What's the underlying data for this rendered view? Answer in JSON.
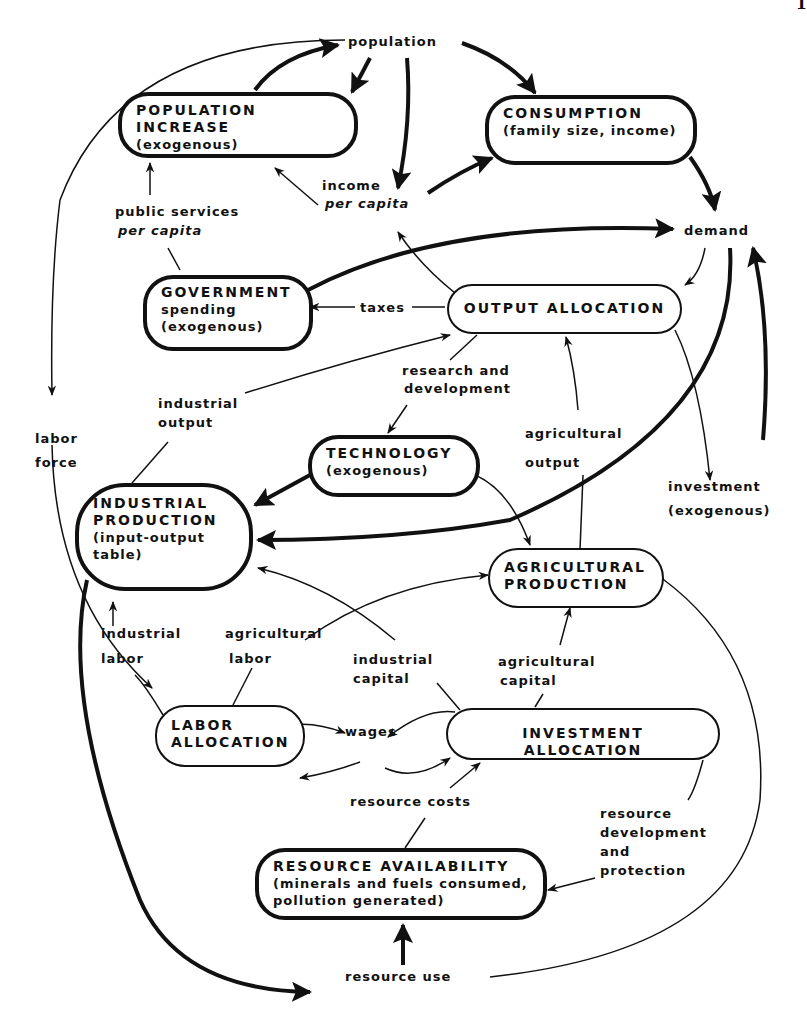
{
  "page_number": "1",
  "nodes": {
    "population_increase": {
      "title": "POPULATION INCREASE",
      "sub": "(exogenous)"
    },
    "consumption": {
      "title": "CONSUMPTION",
      "sub": "(family size, income)"
    },
    "government": {
      "title": "GOVERNMENT",
      "sub1": "spending",
      "sub2": "(exogenous)"
    },
    "output_allocation": {
      "title": "OUTPUT ALLOCATION"
    },
    "technology": {
      "title": "TECHNOLOGY",
      "sub": "(exogenous)"
    },
    "industrial_production": {
      "title1": "INDUSTRIAL",
      "title2": "PRODUCTION",
      "sub1": "(input-output",
      "sub2": "table)"
    },
    "agricultural_production": {
      "title1": "AGRICULTURAL",
      "title2": "PRODUCTION"
    },
    "labor_allocation": {
      "title1": "LABOR",
      "title2": "ALLOCATION"
    },
    "investment_allocation": {
      "title": "INVESTMENT ALLOCATION"
    },
    "resource_availability": {
      "title": "RESOURCE AVAILABILITY",
      "sub1": "(minerals and fuels consumed,",
      "sub2": "pollution generated)"
    }
  },
  "labels": {
    "population": "population",
    "income": "income",
    "per_capita_income": "per capita",
    "public_services": "public services",
    "per_capita_services": "per capita",
    "demand": "demand",
    "taxes": "taxes",
    "research_1": "research and",
    "research_2": "development",
    "industrial_output_1": "industrial",
    "industrial_output_2": "output",
    "labor_force_1": "labor",
    "labor_force_2": "force",
    "agricultural_output_1": "agricultural",
    "agricultural_output_2": "output",
    "investment_1": "investment",
    "investment_2": "(exogenous)",
    "industrial_labor_1": "industrial",
    "industrial_labor_2": "labor",
    "agricultural_labor_1": "agricultural",
    "agricultural_labor_2": "labor",
    "industrial_capital_1": "industrial",
    "industrial_capital_2": "capital",
    "agricultural_capital_1": "agricultural",
    "agricultural_capital_2": "capital",
    "wages": "wages",
    "resource_costs": "resource costs",
    "resource_dev_1": "resource",
    "resource_dev_2": "development",
    "resource_dev_3": "and",
    "resource_dev_4": "protection",
    "resource_use": "resource use"
  }
}
